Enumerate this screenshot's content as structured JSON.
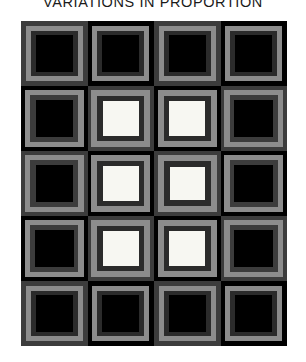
{
  "title": "VARIATIONS IN PROPORTION",
  "artwork": {
    "type": "nested-squares-grid",
    "columns": 4,
    "rows": 5,
    "palette": {
      "black": "#000000",
      "near_black": "#070707",
      "dark_gray": "#2b2b2b",
      "charcoal": "#3c3c3c",
      "mid_gray": "#5c5c5c",
      "light_gray": "#8c8c8c",
      "pale_gray": "#a3a3a3",
      "white": "#f7f7f2",
      "page_background": "#ffffff",
      "title_color": "#1b1b1b"
    },
    "cells": [
      {
        "row": 1,
        "col": 1,
        "outer": "#3c3c3c",
        "rings": [
          "#8c8c8c",
          "#2b2b2b",
          "#000000"
        ],
        "center": "#000000",
        "insets": [
          7,
          15,
          22
        ]
      },
      {
        "row": 1,
        "col": 2,
        "outer": "#000000",
        "rings": [
          "#8c8c8c",
          "#2b2b2b",
          "#000000"
        ],
        "center": "#000000",
        "insets": [
          7,
          15,
          22
        ]
      },
      {
        "row": 1,
        "col": 3,
        "outer": "#3c3c3c",
        "rings": [
          "#8c8c8c",
          "#2b2b2b",
          "#000000"
        ],
        "center": "#000000",
        "insets": [
          7,
          15,
          22
        ]
      },
      {
        "row": 1,
        "col": 4,
        "outer": "#000000",
        "rings": [
          "#8c8c8c",
          "#2b2b2b",
          "#000000"
        ],
        "center": "#000000",
        "insets": [
          7,
          15,
          22
        ]
      },
      {
        "row": 2,
        "col": 1,
        "outer": "#000000",
        "rings": [
          "#8c8c8c",
          "#3c3c3c",
          "#000000"
        ],
        "center": "#000000",
        "insets": [
          6,
          14,
          22
        ]
      },
      {
        "row": 2,
        "col": 2,
        "outer": "#3c3c3c",
        "rings": [
          "#8c8c8c",
          "#2b2b2b",
          "#f7f7f2"
        ],
        "center": "#f7f7f2",
        "insets": [
          6,
          15,
          23
        ]
      },
      {
        "row": 2,
        "col": 3,
        "outer": "#000000",
        "rings": [
          "#8c8c8c",
          "#2b2b2b",
          "#f7f7f2"
        ],
        "center": "#f7f7f2",
        "insets": [
          6,
          15,
          23
        ]
      },
      {
        "row": 2,
        "col": 4,
        "outer": "#3c3c3c",
        "rings": [
          "#8c8c8c",
          "#3c3c3c",
          "#000000"
        ],
        "center": "#000000",
        "insets": [
          6,
          14,
          21
        ]
      },
      {
        "row": 3,
        "col": 1,
        "outer": "#3c3c3c",
        "rings": [
          "#8c8c8c",
          "#3c3c3c",
          "#000000"
        ],
        "center": "#000000",
        "insets": [
          6,
          14,
          22
        ]
      },
      {
        "row": 3,
        "col": 2,
        "outer": "#000000",
        "rings": [
          "#8c8c8c",
          "#2b2b2b",
          "#f7f7f2"
        ],
        "center": "#f7f7f2",
        "insets": [
          6,
          15,
          23
        ]
      },
      {
        "row": 3,
        "col": 3,
        "outer": "#3c3c3c",
        "rings": [
          "#8c8c8c",
          "#2b2b2b",
          "#f7f7f2"
        ],
        "center": "#f7f7f2",
        "insets": [
          6,
          15,
          24
        ]
      },
      {
        "row": 3,
        "col": 4,
        "outer": "#000000",
        "rings": [
          "#8c8c8c",
          "#3c3c3c",
          "#000000"
        ],
        "center": "#000000",
        "insets": [
          6,
          14,
          21
        ]
      },
      {
        "row": 4,
        "col": 1,
        "outer": "#000000",
        "rings": [
          "#8c8c8c",
          "#3c3c3c",
          "#000000"
        ],
        "center": "#000000",
        "insets": [
          6,
          14,
          21
        ]
      },
      {
        "row": 4,
        "col": 2,
        "outer": "#3c3c3c",
        "rings": [
          "#8c8c8c",
          "#2b2b2b",
          "#f7f7f2"
        ],
        "center": "#f7f7f2",
        "insets": [
          6,
          15,
          23
        ]
      },
      {
        "row": 4,
        "col": 3,
        "outer": "#000000",
        "rings": [
          "#8c8c8c",
          "#2b2b2b",
          "#f7f7f2"
        ],
        "center": "#f7f7f2",
        "insets": [
          6,
          15,
          23
        ]
      },
      {
        "row": 4,
        "col": 4,
        "outer": "#3c3c3c",
        "rings": [
          "#8c8c8c",
          "#3c3c3c",
          "#000000"
        ],
        "center": "#000000",
        "insets": [
          6,
          14,
          21
        ]
      },
      {
        "row": 5,
        "col": 1,
        "outer": "#3c3c3c",
        "rings": [
          "#8c8c8c",
          "#2b2b2b",
          "#000000"
        ],
        "center": "#000000",
        "insets": [
          7,
          15,
          22
        ]
      },
      {
        "row": 5,
        "col": 2,
        "outer": "#000000",
        "rings": [
          "#8c8c8c",
          "#2b2b2b",
          "#000000"
        ],
        "center": "#000000",
        "insets": [
          7,
          15,
          22
        ]
      },
      {
        "row": 5,
        "col": 3,
        "outer": "#3c3c3c",
        "rings": [
          "#8c8c8c",
          "#2b2b2b",
          "#000000"
        ],
        "center": "#000000",
        "insets": [
          7,
          15,
          22
        ]
      },
      {
        "row": 5,
        "col": 4,
        "outer": "#000000",
        "rings": [
          "#8c8c8c",
          "#2b2b2b",
          "#000000"
        ],
        "center": "#000000",
        "insets": [
          7,
          15,
          22
        ]
      }
    ]
  }
}
